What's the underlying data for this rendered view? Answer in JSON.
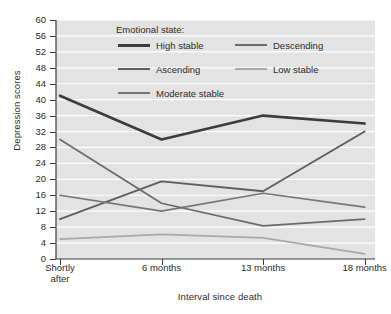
{
  "chart_data": {
    "type": "line",
    "title": "",
    "xlabel": "Interval since death",
    "ylabel": "Depression scores",
    "categories": [
      "Shortly after",
      "6 months",
      "13 months",
      "18 months"
    ],
    "category_lines": [
      [
        "Shortly",
        "after"
      ],
      [
        "6 months"
      ],
      [
        "13 months"
      ],
      [
        "18 months"
      ]
    ],
    "ylim": [
      0,
      60
    ],
    "yticks": [
      0,
      4,
      8,
      12,
      16,
      20,
      24,
      28,
      32,
      36,
      40,
      44,
      48,
      52,
      56,
      60
    ],
    "grid": "horizontal",
    "legend_position": "inside-top",
    "legend_title": "Emotional state:",
    "series": [
      {
        "name": "High stable",
        "values": [
          41,
          30,
          36,
          34
        ],
        "color": "#3c3c3c",
        "width": 2.6
      },
      {
        "name": "Ascending",
        "values": [
          10,
          19.5,
          17,
          32
        ],
        "color": "#5e5e5e",
        "width": 1.9
      },
      {
        "name": "Moderate stable",
        "values": [
          16,
          12,
          16.5,
          13
        ],
        "color": "#757575",
        "width": 1.7
      },
      {
        "name": "Descending",
        "values": [
          30,
          14,
          8.3,
          10
        ],
        "color": "#6b6b6b",
        "width": 1.7
      },
      {
        "name": "Low stable",
        "values": [
          5,
          6.2,
          5.3,
          1.3
        ],
        "color": "#a8a8a8",
        "width": 1.7
      }
    ],
    "legend_layout": [
      {
        "name": "High stable",
        "col": 0,
        "row": 0
      },
      {
        "name": "Descending",
        "col": 1,
        "row": 0
      },
      {
        "name": "Ascending",
        "col": 0,
        "row": 1
      },
      {
        "name": "Low stable",
        "col": 1,
        "row": 1
      },
      {
        "name": "Moderate stable",
        "col": 0,
        "row": 2
      }
    ],
    "plot_background": "#e3e3e3",
    "gridline_color": "#ffffff",
    "axis_color": "#3a3a3a"
  }
}
